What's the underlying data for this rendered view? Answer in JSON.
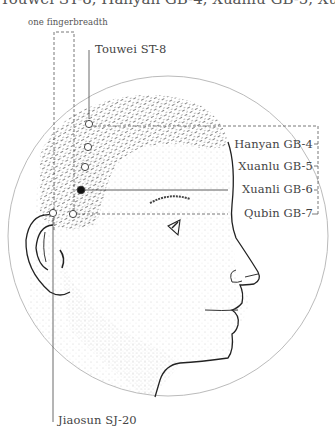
{
  "title": "Touwei ST-8, Hanyan GB-4, Xuanlu GB-5, Xuanli GB-6 and Qubin GB-7",
  "measure_label": "one fingerbreadth",
  "points": [
    {
      "id": "touwei",
      "label": "Touwei ST-8",
      "x": 89,
      "y": 124,
      "filled": false
    },
    {
      "id": "hanyan",
      "label": "Hanyan GB-4",
      "x": 88,
      "y": 147,
      "filled": false
    },
    {
      "id": "xuanlu",
      "label": "Xuanlu GB-5",
      "x": 85,
      "y": 167,
      "filled": false
    },
    {
      "id": "xuanli",
      "label": "Xuanli GB-6",
      "x": 81,
      "y": 190,
      "filled": true
    },
    {
      "id": "qubin",
      "label": "Qubin GB-7",
      "x": 73,
      "y": 214,
      "filled": false
    },
    {
      "id": "jiaosun",
      "label": "Jiaosun SJ-20",
      "x": 53,
      "y": 213,
      "filled": false
    }
  ],
  "labels": {
    "touwei": "Touwei ST-8",
    "hanyan": "Hanyan GB-4",
    "xuanlu": "Xuanlu GB-5",
    "xuanli": "Xuanli GB-6",
    "qubin": "Qubin GB-7",
    "jiaosun": "Jiaosun SJ-20"
  }
}
